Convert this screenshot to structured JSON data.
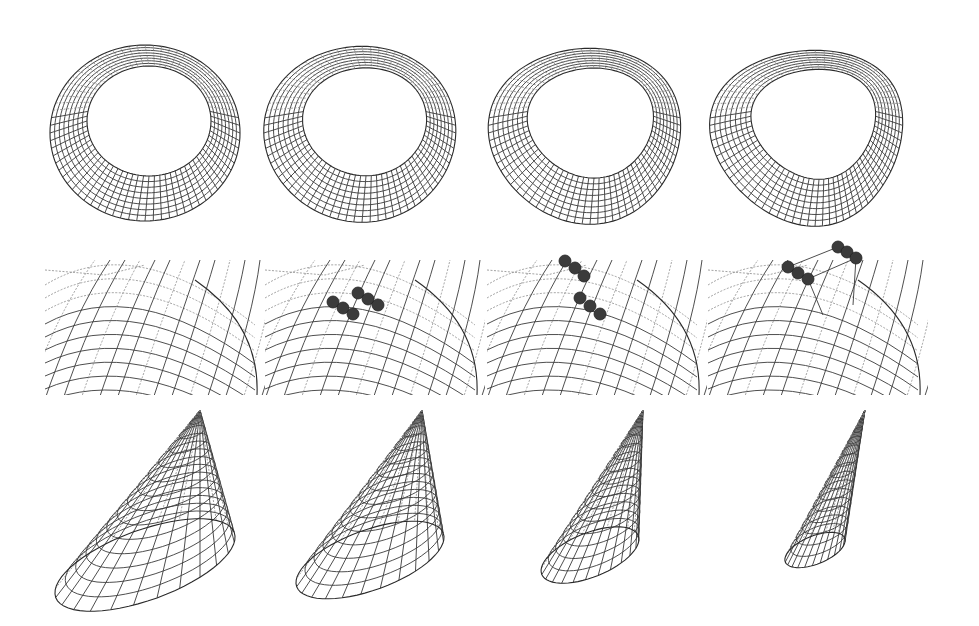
{
  "figure": {
    "background": "#ffffff",
    "ink_color": "#3a3a3a",
    "rows": [
      {
        "id": "torus-row",
        "subject": "torus",
        "panels": [
          {
            "stage": 1,
            "shape": "round torus",
            "cx": 145,
            "cy": 133,
            "rx": 95,
            "ry": 88,
            "hole_rx": 62,
            "hole_ry": 55,
            "skew": 0
          },
          {
            "stage": 2,
            "shape": "slightly skewed torus",
            "cx": 362,
            "cy": 133,
            "rx": 96,
            "ry": 88,
            "hole_rx": 62,
            "hole_ry": 54,
            "skew": 0.1
          },
          {
            "stage": 3,
            "shape": "teardrop torus",
            "cx": 590,
            "cy": 133,
            "rx": 96,
            "ry": 88,
            "hole_rx": 63,
            "hole_ry": 55,
            "skew": 0.25
          },
          {
            "stage": 4,
            "shape": "strongly teardrop torus",
            "cx": 815,
            "cy": 133,
            "rx": 96,
            "ry": 88,
            "hole_rx": 62,
            "hole_ry": 55,
            "skew": 0.4
          }
        ]
      },
      {
        "id": "surface-row",
        "subject": "wireframe surface patch with control points",
        "panels": [
          {
            "stage": 1,
            "x": 45,
            "control_point_groups": 0
          },
          {
            "stage": 2,
            "x": 265,
            "control_point_groups": 2,
            "lift": 0
          },
          {
            "stage": 3,
            "x": 487,
            "control_point_groups": 2,
            "lift": 1
          },
          {
            "stage": 4,
            "x": 708,
            "control_point_groups": 2,
            "lift": 2
          }
        ]
      },
      {
        "id": "cone-row",
        "subject": "cone",
        "panels": [
          {
            "stage": 1,
            "apex": [
              200,
              410
            ],
            "base_cx": 145,
            "base_cy": 565,
            "base_rx": 95,
            "base_ry": 35,
            "tilt": -20
          },
          {
            "stage": 2,
            "apex": [
              422,
              410
            ],
            "base_cx": 370,
            "base_cy": 560,
            "base_rx": 78,
            "base_ry": 30,
            "tilt": -20
          },
          {
            "stage": 3,
            "apex": [
              643,
              410
            ],
            "base_cx": 590,
            "base_cy": 555,
            "base_rx": 52,
            "base_ry": 22,
            "tilt": -22
          },
          {
            "stage": 4,
            "apex": [
              865,
              410
            ],
            "base_cx": 815,
            "base_cy": 550,
            "base_rx": 32,
            "base_ry": 14,
            "tilt": -22
          }
        ]
      }
    ]
  }
}
